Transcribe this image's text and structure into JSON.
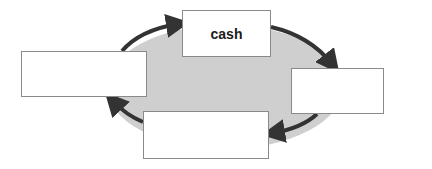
{
  "diagram": {
    "type": "cycle",
    "colors": {
      "fill": "#cfcfcf",
      "arrow": "#333333",
      "box_border": "#8a8a8a"
    },
    "nodes": [
      {
        "id": "top",
        "label": "cash",
        "x": 182,
        "y": 10,
        "w": 89,
        "h": 47
      },
      {
        "id": "right",
        "label": "",
        "x": 291,
        "y": 68,
        "w": 93,
        "h": 46
      },
      {
        "id": "bottom",
        "label": "",
        "x": 143,
        "y": 111,
        "w": 126,
        "h": 48
      },
      {
        "id": "left",
        "label": "",
        "x": 21,
        "y": 51,
        "w": 126,
        "h": 46
      }
    ],
    "arrows": [
      {
        "from": "left",
        "to": "top"
      },
      {
        "from": "top",
        "to": "right"
      },
      {
        "from": "right",
        "to": "bottom"
      },
      {
        "from": "bottom",
        "to": "left"
      }
    ]
  }
}
